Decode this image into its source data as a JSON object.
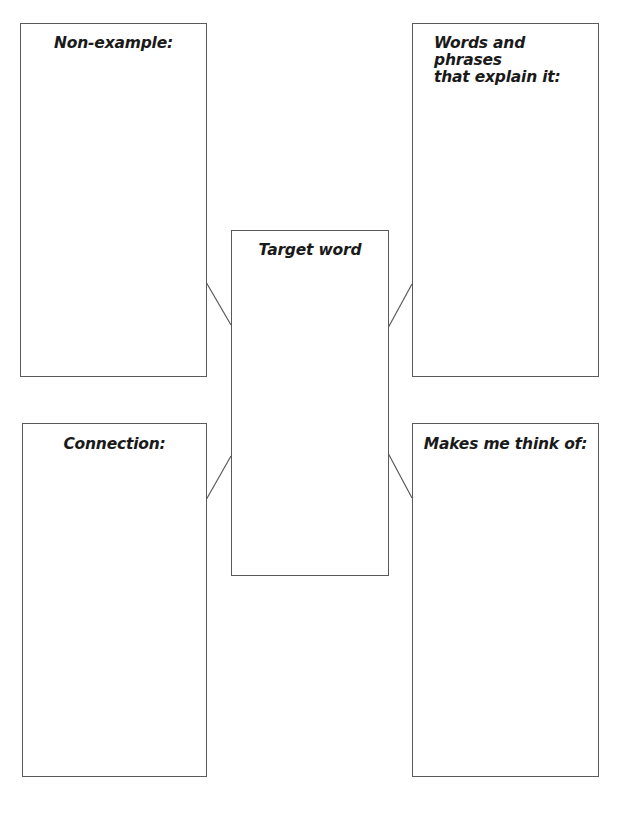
{
  "worksheet": {
    "boxes": {
      "non_example": {
        "label": "Non-example:"
      },
      "words_phrases": {
        "label_line1": "Words and phrases",
        "label_line2": "that explain it:"
      },
      "target_word": {
        "label": "Target word"
      },
      "connection": {
        "label": "Connection:"
      },
      "makes_me_think": {
        "label": "Makes me think of:"
      }
    },
    "colors": {
      "border": "#5a5a5a",
      "text": "#1a1a1a",
      "background": "#ffffff"
    }
  }
}
